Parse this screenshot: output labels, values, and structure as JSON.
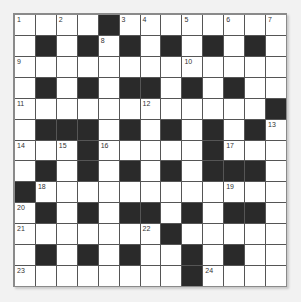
{
  "puzzle": {
    "size": 13,
    "rows": [
      "....#........",
      ".#.#.#.#.#.#.",
      ".............",
      ".#.#.##.#.#..",
      "............#",
      ".###.#.#.#.#.",
      "...#.....#...",
      ".#.#.#.#.###.",
      "#............",
      ".#.#.##.#.##.",
      ".......#.....",
      ".#.#.#..#.#..",
      "........#...."
    ],
    "numbers": [
      {
        "r": 0,
        "c": 0,
        "n": "1"
      },
      {
        "r": 0,
        "c": 2,
        "n": "2"
      },
      {
        "r": 0,
        "c": 5,
        "n": "3"
      },
      {
        "r": 0,
        "c": 6,
        "n": "4"
      },
      {
        "r": 0,
        "c": 8,
        "n": "5"
      },
      {
        "r": 0,
        "c": 10,
        "n": "6"
      },
      {
        "r": 0,
        "c": 12,
        "n": "7"
      },
      {
        "r": 1,
        "c": 4,
        "n": "8"
      },
      {
        "r": 2,
        "c": 0,
        "n": "9"
      },
      {
        "r": 2,
        "c": 8,
        "n": "10"
      },
      {
        "r": 4,
        "c": 0,
        "n": "11"
      },
      {
        "r": 4,
        "c": 6,
        "n": "12"
      },
      {
        "r": 5,
        "c": 12,
        "n": "13"
      },
      {
        "r": 6,
        "c": 0,
        "n": "14"
      },
      {
        "r": 6,
        "c": 2,
        "n": "15"
      },
      {
        "r": 6,
        "c": 4,
        "n": "16"
      },
      {
        "r": 6,
        "c": 10,
        "n": "17"
      },
      {
        "r": 8,
        "c": 1,
        "n": "18"
      },
      {
        "r": 8,
        "c": 10,
        "n": "19"
      },
      {
        "r": 9,
        "c": 0,
        "n": "20"
      },
      {
        "r": 10,
        "c": 0,
        "n": "21"
      },
      {
        "r": 10,
        "c": 6,
        "n": "22"
      },
      {
        "r": 12,
        "c": 0,
        "n": "23"
      },
      {
        "r": 12,
        "c": 9,
        "n": "24"
      }
    ]
  }
}
